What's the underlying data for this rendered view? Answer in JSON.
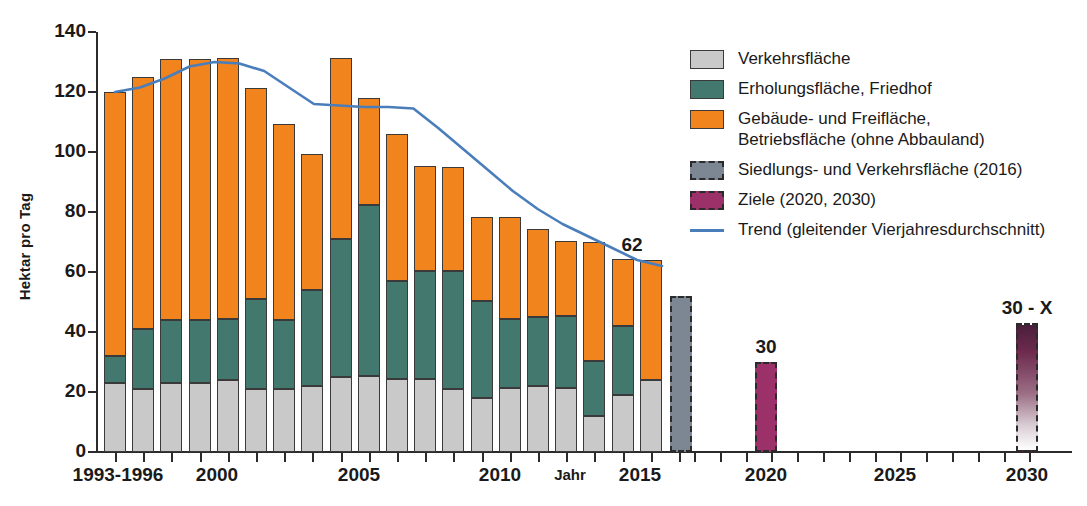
{
  "chart_data": {
    "type": "bar",
    "title": "",
    "xlabel": "Jahr",
    "ylabel": "Hektar pro Tag",
    "ylim": [
      0,
      140
    ],
    "ytick_values": [
      0,
      20,
      40,
      60,
      80,
      100,
      120,
      140
    ],
    "xtick_labels": [
      "1993-1996",
      "2000",
      "2005",
      "2010",
      "2015",
      "2020",
      "2025",
      "2030"
    ],
    "grid": false,
    "legend_position": "right",
    "stacked": true,
    "categories": [
      "1993-1996",
      "1997",
      "1998",
      "1999",
      "2000",
      "2001",
      "2002",
      "2003",
      "2004",
      "2005",
      "2006",
      "2007",
      "2008",
      "2009",
      "2010",
      "2011",
      "2012",
      "2013",
      "2014",
      "2015"
    ],
    "series": [
      {
        "name": "Verkehrsfläche",
        "color": "#c9c9c9",
        "values": [
          23,
          21,
          23,
          23,
          24,
          21,
          21,
          22,
          25,
          25.5,
          24.5,
          24.5,
          21,
          18,
          21.5,
          22,
          21.5,
          12,
          19,
          24
        ]
      },
      {
        "name": "Erholungsfläche, Friedhof",
        "color": "#43786f",
        "values": [
          9,
          20,
          21,
          21,
          20.5,
          30,
          23,
          32,
          46,
          57,
          32.5,
          36,
          39.5,
          32.5,
          23,
          23,
          24,
          18.5,
          23,
          -2
        ]
      },
      {
        "name": "Gebäude- und Freifläche, Betriebsfläche (ohne Abbauland)",
        "color": "#f2841e",
        "values": [
          88,
          84,
          87,
          87,
          87,
          70.5,
          65.5,
          45.5,
          60.5,
          35.5,
          49,
          35,
          34.5,
          28,
          34,
          29.5,
          25,
          39.5,
          22.5,
          40
        ]
      }
    ],
    "totals": [
      120,
      125,
      131,
      131,
      131.5,
      121.5,
      110,
      99.5,
      131.5,
      118,
      106,
      95.5,
      95,
      78.5,
      78.5,
      74.5,
      70.5,
      70,
      64.5,
      62
    ],
    "special_bars": [
      {
        "label": "Siedlungs- und Verkehrsfläche (2016)",
        "year": "2016",
        "value": 52,
        "style": "dashed-grey",
        "color": "#7c8793",
        "annotation": ""
      },
      {
        "label": "Ziele (2020, 2030)",
        "year": "2020",
        "value": 30,
        "style": "dashed-magenta",
        "color": "#9c3069",
        "annotation": "30"
      },
      {
        "label": "Ziele (2020, 2030)",
        "year": "2030",
        "value": 43,
        "style": "dashed-gradient",
        "color": "#4a1f3c",
        "annotation": "30 - X"
      }
    ],
    "trend": {
      "name": "Trend (gleitender Vierjahresdurchschnitt)",
      "color": "#4a7ebb",
      "annotation": "62",
      "values": [
        120,
        121.5,
        124.5,
        128.5,
        130,
        129.5,
        127,
        121.5,
        116,
        115.5,
        115,
        115,
        114.5,
        108,
        101,
        94,
        87,
        81,
        76,
        72,
        68,
        64,
        62
      ]
    }
  },
  "yaxis": {
    "title": "Hektar pro Tag",
    "ticks": [
      "140",
      "120",
      "100",
      "80",
      "60",
      "40",
      "20",
      "0"
    ]
  },
  "xaxis": {
    "title": "Jahr",
    "labels": [
      "1993-1996",
      "2000",
      "2005",
      "2010",
      "2015",
      "2020",
      "2025",
      "2030"
    ]
  },
  "annotations": {
    "trend_end": "62",
    "goal_2020": "30",
    "goal_2030": "30 - X"
  },
  "legend": {
    "items": [
      {
        "label": "Verkehrsfläche",
        "label2": "",
        "swatch": "sw-traffic",
        "icon": "legend-swatch-traffic"
      },
      {
        "label": "Erholungsfläche, Friedhof",
        "label2": "",
        "swatch": "sw-rec",
        "icon": "legend-swatch-recreation"
      },
      {
        "label": "Gebäude- und Freifläche,",
        "label2": "Betriebsfläche (ohne Abbauland)",
        "swatch": "sw-build",
        "icon": "legend-swatch-building"
      },
      {
        "label": "Siedlungs- und Verkehrsfläche (2016)",
        "label2": "",
        "swatch": "sw-svf",
        "icon": "legend-swatch-settlement"
      },
      {
        "label": "Ziele (2020, 2030)",
        "label2": "",
        "swatch": "sw-goal",
        "icon": "legend-swatch-goals"
      },
      {
        "label": "Trend (gleitender Vierjahresdurchschnitt)",
        "label2": "",
        "swatch": "sw-line",
        "icon": "legend-swatch-trend-line"
      }
    ]
  },
  "colors": {
    "traffic": "#c9c9c9",
    "recreation": "#43786f",
    "building": "#f2841e",
    "settlement": "#7c8793",
    "goal": "#9c3069",
    "trend": "#4a7ebb",
    "axis": "#2b2b2b"
  }
}
